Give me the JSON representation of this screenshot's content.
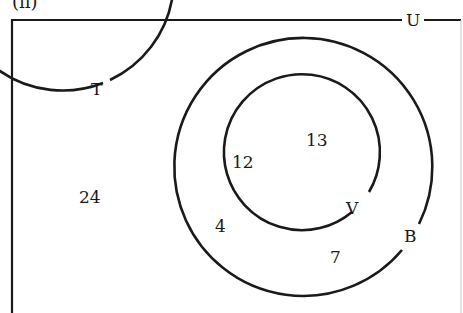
{
  "part_label": "(ii)",
  "universal_label": "U",
  "sets": [
    {
      "name": "T",
      "cx": 163,
      "cy": 176,
      "r": 111
    },
    {
      "name": "B",
      "cx": 307,
      "cy": 166,
      "r": 129
    },
    {
      "name": "V",
      "cx": 296,
      "cy": 159,
      "r": 78
    }
  ],
  "regions": {
    "T_only": "24",
    "T_and_V": "12",
    "V_only": "13",
    "T_and_B_not_V": "4",
    "B_only": "7"
  },
  "colors": {
    "stroke": "#1a1a1a",
    "border_right": "#c8c8c8",
    "background": "#ffffff"
  }
}
